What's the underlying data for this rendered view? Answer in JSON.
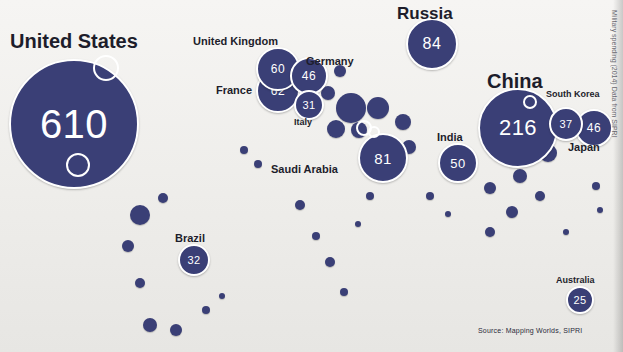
{
  "figure": {
    "source_note": "Source: Mapping Worlds, SIPRI",
    "margin_note": "Military spending (2014) Data from SIPRI"
  },
  "chart_data": {
    "type": "bubble",
    "title": "",
    "subtitle": "",
    "xlabel": "",
    "ylabel": "",
    "units": "US$ billion",
    "source": "Source: Mapping Worlds, SIPRI",
    "legend": "none",
    "grid": false,
    "categories": [
      "United States",
      "China",
      "Russia",
      "Saudi Arabia",
      "France",
      "United Kingdom",
      "India",
      "Germany",
      "Japan",
      "South Korea",
      "Brazil",
      "Italy",
      "Australia"
    ],
    "values": [
      610,
      216,
      84,
      81,
      62,
      60,
      50,
      46,
      46,
      37,
      32,
      31,
      25
    ],
    "points": [
      {
        "label": "United States",
        "value": 610,
        "x": 72,
        "y": 122,
        "r": 63,
        "label_x": 10,
        "label_y": 30,
        "label_size": "xl"
      },
      {
        "label": "China",
        "value": 216,
        "x": 516,
        "y": 126,
        "r": 38,
        "label_x": 487,
        "label_y": 70,
        "label_size": "xl"
      },
      {
        "label": "Russia",
        "value": 84,
        "x": 430,
        "y": 42,
        "r": 24,
        "label_x": 397,
        "label_y": 4,
        "label_size": "lg"
      },
      {
        "label": "Saudi Arabia",
        "value": 81,
        "x": 381,
        "y": 156,
        "r": 23,
        "label_x": 271,
        "label_y": 163,
        "label_size": "md"
      },
      {
        "label": "France",
        "value": 62,
        "x": 276,
        "y": 89,
        "r": 20,
        "label_x": 216,
        "label_y": 84,
        "label_size": "md"
      },
      {
        "label": "United Kingdom",
        "value": 60,
        "x": 276,
        "y": 67,
        "r": 20,
        "label_x": 193,
        "label_y": 35,
        "label_size": "md"
      },
      {
        "label": "India",
        "value": 50,
        "x": 456,
        "y": 161,
        "r": 18,
        "label_x": 437,
        "label_y": 131,
        "label_size": "md"
      },
      {
        "label": "Germany",
        "value": 46,
        "x": 307,
        "y": 74,
        "r": 17,
        "label_x": 306,
        "label_y": 55,
        "label_size": "md"
      },
      {
        "label": "Japan",
        "value": 46,
        "x": 592,
        "y": 126,
        "r": 17,
        "label_x": 568,
        "label_y": 141,
        "label_size": "md"
      },
      {
        "label": "South Korea",
        "value": 37,
        "x": 564,
        "y": 122,
        "r": 15,
        "label_x": 546,
        "label_y": 89,
        "label_size": "sm"
      },
      {
        "label": "Brazil",
        "value": 32,
        "x": 192,
        "y": 258,
        "r": 14,
        "label_x": 175,
        "label_y": 232,
        "label_size": "md"
      },
      {
        "label": "Italy",
        "value": 31,
        "x": 307,
        "y": 103,
        "r": 13,
        "label_x": 294,
        "label_y": 117,
        "label_size": "sm"
      },
      {
        "label": "Australia",
        "value": 25,
        "x": 578,
        "y": 298,
        "r": 12,
        "label_x": 556,
        "label_y": 275,
        "label_size": "sm"
      }
    ]
  },
  "unlabeled_bubbles": [
    {
      "x": 351,
      "y": 108,
      "r": 15
    },
    {
      "x": 378,
      "y": 108,
      "r": 11
    },
    {
      "x": 336,
      "y": 129,
      "r": 9
    },
    {
      "x": 359,
      "y": 130,
      "r": 8
    },
    {
      "x": 403,
      "y": 122,
      "r": 8
    },
    {
      "x": 409,
      "y": 147,
      "r": 7
    },
    {
      "x": 328,
      "y": 93,
      "r": 7
    },
    {
      "x": 340,
      "y": 71,
      "r": 6
    },
    {
      "x": 548,
      "y": 153,
      "r": 9
    },
    {
      "x": 520,
      "y": 176,
      "r": 7
    },
    {
      "x": 490,
      "y": 188,
      "r": 6
    },
    {
      "x": 540,
      "y": 196,
      "r": 5
    },
    {
      "x": 512,
      "y": 212,
      "r": 6
    },
    {
      "x": 490,
      "y": 232,
      "r": 5
    },
    {
      "x": 140,
      "y": 215,
      "r": 10
    },
    {
      "x": 163,
      "y": 198,
      "r": 5
    },
    {
      "x": 128,
      "y": 246,
      "r": 6
    },
    {
      "x": 140,
      "y": 283,
      "r": 5
    },
    {
      "x": 150,
      "y": 325,
      "r": 7
    },
    {
      "x": 176,
      "y": 330,
      "r": 6
    },
    {
      "x": 206,
      "y": 310,
      "r": 4
    },
    {
      "x": 222,
      "y": 296,
      "r": 3
    },
    {
      "x": 300,
      "y": 205,
      "r": 5
    },
    {
      "x": 316,
      "y": 236,
      "r": 4
    },
    {
      "x": 330,
      "y": 262,
      "r": 5
    },
    {
      "x": 344,
      "y": 292,
      "r": 4
    },
    {
      "x": 358,
      "y": 224,
      "r": 3
    },
    {
      "x": 370,
      "y": 196,
      "r": 4
    },
    {
      "x": 258,
      "y": 164,
      "r": 4
    },
    {
      "x": 244,
      "y": 150,
      "r": 4
    },
    {
      "x": 430,
      "y": 196,
      "r": 4
    },
    {
      "x": 448,
      "y": 214,
      "r": 3
    },
    {
      "x": 596,
      "y": 186,
      "r": 4
    },
    {
      "x": 600,
      "y": 210,
      "r": 3
    },
    {
      "x": 566,
      "y": 232,
      "r": 3
    }
  ],
  "white_holes": [
    {
      "x": 104,
      "y": 66,
      "r": 11
    },
    {
      "x": 76,
      "y": 163,
      "r": 10
    },
    {
      "x": 362,
      "y": 126,
      "r": 6
    },
    {
      "x": 372,
      "y": 130,
      "r": 4
    },
    {
      "x": 528,
      "y": 100,
      "r": 5
    }
  ]
}
